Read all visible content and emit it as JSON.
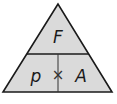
{
  "diagram": {
    "type": "formula-triangle",
    "top": "F",
    "bottom_left": "p",
    "bottom_right": "A",
    "operator": "×",
    "colors": {
      "fill": "#dadada",
      "stroke": "#1a1a1a",
      "background": "#ffffff"
    }
  }
}
